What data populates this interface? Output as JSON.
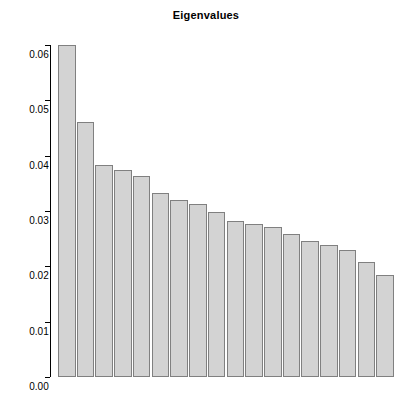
{
  "chart_data": {
    "type": "bar",
    "title": "Eigenvalues",
    "xlabel": "",
    "ylabel": "",
    "grid": false,
    "legend": false,
    "ylim": [
      0.0,
      0.06
    ],
    "ytick_labels": [
      "0.00",
      "0.01",
      "0.02",
      "0.03",
      "0.04",
      "0.05",
      "0.06"
    ],
    "ytick_values": [
      0.0,
      0.01,
      0.02,
      0.03,
      0.04,
      0.05,
      0.06
    ],
    "xtick_labels": [],
    "categories": [
      "1",
      "2",
      "3",
      "4",
      "5",
      "6",
      "7",
      "8",
      "9",
      "10",
      "11",
      "12",
      "13",
      "14",
      "15",
      "16",
      "17",
      "18"
    ],
    "values": [
      0.06,
      0.0461,
      0.0383,
      0.0374,
      0.0363,
      0.0332,
      0.032,
      0.0313,
      0.0298,
      0.0282,
      0.0276,
      0.0271,
      0.0258,
      0.0246,
      0.0239,
      0.0229,
      0.0208,
      0.0184
    ],
    "bar_fill_color": "#d3d3d3",
    "bar_border_color": "#808080",
    "axis_color": "#000000",
    "background_color": "#ffffff"
  }
}
